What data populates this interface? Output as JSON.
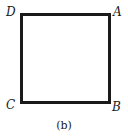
{
  "figure": {
    "caption": "(b)",
    "shape": "square",
    "vertices": {
      "top_left": "D",
      "top_right": "A",
      "bottom_right": "B",
      "bottom_left": "C"
    },
    "stroke_color": "#1a1a1a"
  }
}
